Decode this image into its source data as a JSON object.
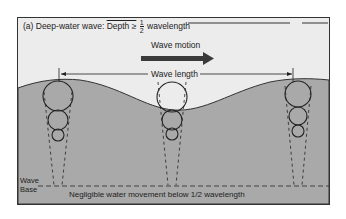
{
  "title": {
    "prefix": "(a) Deep-water wave:",
    "condition": "Depth ≥",
    "fraction_num": "1",
    "fraction_den": "2",
    "suffix": "wavelength"
  },
  "labels": {
    "wave_motion": "Wave motion",
    "wave_length": "Wave length",
    "wave_base_line1": "Wave",
    "wave_base_line2": "Base",
    "negligible": "Negligible water movement below 1/2 wavelength"
  },
  "colors": {
    "water": "#a9a9a9",
    "air": "#ececec",
    "arrow": "#3a3a3a",
    "line": "#222222"
  },
  "orbit_columns": [
    {
      "x": 60,
      "surface_y": 81,
      "radii": [
        15,
        10,
        6
      ]
    },
    {
      "x": 174,
      "surface_y": 110,
      "radii": [
        15,
        10,
        6
      ]
    },
    {
      "x": 297,
      "surface_y": 81,
      "radii": [
        15,
        10,
        6
      ]
    }
  ]
}
